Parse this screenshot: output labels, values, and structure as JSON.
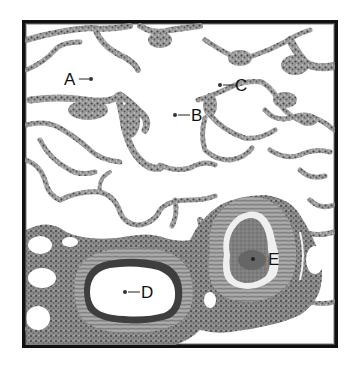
{
  "figure": {
    "frame_color": "#111111",
    "background": "#ffffff",
    "labels": [
      {
        "id": "A",
        "text": "A",
        "x": 66,
        "y": 86,
        "dot_x": 91,
        "dot_y": 79,
        "side": "left"
      },
      {
        "id": "B",
        "text": "B",
        "x": 192,
        "y": 122,
        "dot_x": 175,
        "dot_y": 115,
        "side": "right"
      },
      {
        "id": "C",
        "text": "C",
        "x": 236,
        "y": 92,
        "dot_x": 221,
        "dot_y": 85,
        "side": "right"
      },
      {
        "id": "D",
        "text": "D",
        "x": 142,
        "y": 298,
        "dot_x": 126,
        "dot_y": 292,
        "side": "right"
      },
      {
        "id": "E",
        "text": "E",
        "x": 269,
        "y": 266,
        "dot_x": 253,
        "dot_y": 259,
        "side": "right"
      }
    ]
  }
}
